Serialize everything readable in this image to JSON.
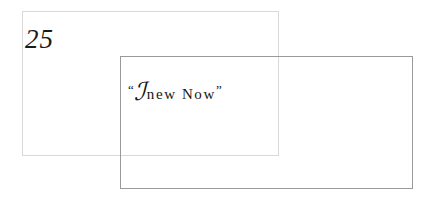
{
  "slide": {
    "background_color": "#ffffff",
    "width": 432,
    "height": 202,
    "number_label": "25",
    "frames": [
      {
        "name": "back-frame",
        "border_color": "#d9d9d9",
        "x": 22,
        "y": 11,
        "width": 257,
        "height": 145
      },
      {
        "name": "front-frame",
        "border_color": "#9a9a9a",
        "x": 120,
        "y": 56,
        "width": 293,
        "height": 133
      }
    ],
    "quote": {
      "open_mark": "“",
      "initial": "ℐ",
      "words": "new Now",
      "close_mark": "”",
      "full_text": "“A new Now”",
      "text_color": "#161616"
    }
  }
}
